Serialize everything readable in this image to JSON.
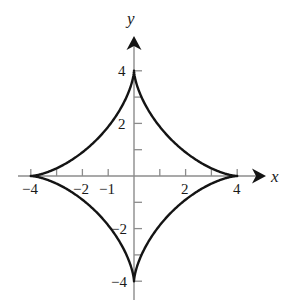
{
  "figure": {
    "background_color": "#ffffff",
    "curve_color": "#141414",
    "axis_color": "#8c8c8c",
    "text_color": "#1a1a1a"
  },
  "axes": {
    "x_axis_label": "x",
    "y_axis_label": "y",
    "origin_px": {
      "x": 134,
      "y": 176
    },
    "unit_px": {
      "x": 25.8,
      "y": 26.3
    },
    "x_tick_labels": [
      {
        "text": "−4",
        "value": -4
      },
      {
        "text": "−2",
        "value": -2
      },
      {
        "text": "−1",
        "value": -1
      },
      {
        "text": "2",
        "value": 2
      },
      {
        "text": "4",
        "value": 4
      }
    ],
    "y_tick_labels": [
      {
        "text": "4",
        "value": 4
      },
      {
        "text": "2",
        "value": 2
      },
      {
        "text": "−2",
        "value": -2
      },
      {
        "text": "−4",
        "value": -4
      }
    ],
    "x_tick_values": [
      -4,
      -3,
      -2,
      -1,
      1,
      2,
      3,
      4
    ],
    "y_tick_values": [
      4,
      3,
      2,
      1,
      -1,
      -2,
      -3,
      -4
    ]
  },
  "chart_data": {
    "type": "line",
    "title": "",
    "xlabel": "x",
    "ylabel": "y",
    "xlim": [
      -5.2,
      6.0
    ],
    "ylim": [
      -5.0,
      5.2
    ],
    "grid": false,
    "legend": "none",
    "curve_name": "astroid",
    "equation": "x^(2/3) + y^(2/3) = 4^(2/3)",
    "parametric": "x = 4 cos^3 t, y = 4 sin^3 t",
    "cusps": [
      {
        "x": 4,
        "y": 0
      },
      {
        "x": 0,
        "y": 4
      },
      {
        "x": -4,
        "y": 0
      },
      {
        "x": 0,
        "y": -4
      }
    ],
    "x": [
      4,
      3.88,
      3.54,
      3.03,
      2.41,
      1.76,
      1.15,
      0.64,
      0.26,
      0.05,
      0,
      0.05,
      0.26,
      0.64,
      1.15,
      1.76,
      2.41,
      3.03,
      3.54,
      3.88,
      4
    ],
    "y": [
      0,
      0.05,
      0.26,
      0.64,
      1.15,
      1.76,
      2.41,
      3.03,
      3.54,
      3.88,
      4,
      3.88,
      3.54,
      3.03,
      2.41,
      1.76,
      1.15,
      0.64,
      0.26,
      0.05,
      0
    ]
  }
}
